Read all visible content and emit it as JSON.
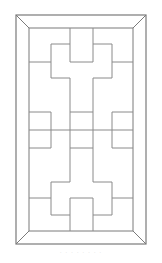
{
  "diagram": {
    "stroke_color": "#8a8a8a",
    "frame_color": "#7a7a7a",
    "outer_frame": {
      "x1": 16,
      "y1": 15,
      "x2": 146,
      "y2": 244
    },
    "inner_frame": {
      "x1": 29,
      "y1": 28,
      "x2": 133,
      "y2": 231
    },
    "lines": [
      [
        51,
        62,
        51,
        44
      ],
      [
        51,
        44,
        70,
        44
      ],
      [
        70,
        44,
        70,
        28
      ],
      [
        93,
        28,
        93,
        44
      ],
      [
        93,
        44,
        112,
        44
      ],
      [
        112,
        44,
        112,
        62
      ],
      [
        70,
        62,
        93,
        62
      ],
      [
        70,
        44,
        70,
        62
      ],
      [
        93,
        44,
        93,
        62
      ],
      [
        29,
        62,
        51,
        62
      ],
      [
        112,
        62,
        133,
        62
      ],
      [
        51,
        62,
        51,
        78
      ],
      [
        51,
        78,
        70,
        78
      ],
      [
        70,
        78,
        70,
        182
      ],
      [
        112,
        62,
        112,
        78
      ],
      [
        112,
        78,
        93,
        78
      ],
      [
        93,
        78,
        93,
        182
      ],
      [
        29,
        112,
        51,
        112
      ],
      [
        51,
        112,
        51,
        148
      ],
      [
        51,
        148,
        29,
        148
      ],
      [
        133,
        112,
        112,
        112
      ],
      [
        112,
        112,
        112,
        148
      ],
      [
        112,
        148,
        133,
        148
      ],
      [
        70,
        112,
        93,
        112
      ],
      [
        70,
        148,
        93,
        148
      ],
      [
        29,
        130,
        133,
        130
      ],
      [
        70,
        182,
        51,
        182
      ],
      [
        51,
        182,
        51,
        215
      ],
      [
        51,
        215,
        70,
        215
      ],
      [
        93,
        182,
        112,
        182
      ],
      [
        112,
        182,
        112,
        215
      ],
      [
        112,
        215,
        93,
        215
      ],
      [
        29,
        198,
        51,
        198
      ],
      [
        112,
        198,
        133,
        198
      ],
      [
        70,
        198,
        93,
        198
      ],
      [
        70,
        198,
        70,
        231
      ],
      [
        93,
        198,
        93,
        231
      ]
    ]
  },
  "caption": {
    "text": "· · ·  · · · · ·"
  }
}
